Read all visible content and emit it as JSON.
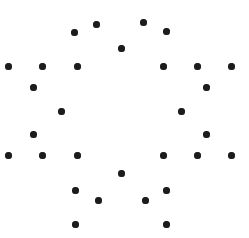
{
  "canvas": {
    "width": 249,
    "height": 238,
    "background_color": "#ffffff",
    "description": "Scattered black dot pattern forming a symmetric hexagonal/flower-like arrangement"
  },
  "marker": {
    "shape": "filled-circle",
    "color": "#1c1c1c",
    "diameter": 7,
    "count": 28
  },
  "chart_data": {
    "type": "scatter",
    "title": "",
    "subtitle": "",
    "xlabel": "",
    "ylabel": "",
    "grid": false,
    "legend": "none",
    "xlim": [
      0,
      249
    ],
    "ylim": [
      0,
      238
    ],
    "axis_visible": false,
    "tick_labels_x": [],
    "tick_labels_y": [],
    "annotations": [],
    "series": [
      {
        "name": "dots",
        "color": "#1c1c1c",
        "marker": "circle",
        "size": 7,
        "points": [
          {
            "x": 96,
            "y": 24
          },
          {
            "x": 143,
            "y": 22
          },
          {
            "x": 74,
            "y": 32
          },
          {
            "x": 166,
            "y": 31
          },
          {
            "x": 121,
            "y": 48
          },
          {
            "x": 8,
            "y": 66
          },
          {
            "x": 42,
            "y": 66
          },
          {
            "x": 77,
            "y": 66
          },
          {
            "x": 163,
            "y": 66
          },
          {
            "x": 197,
            "y": 66
          },
          {
            "x": 231,
            "y": 66
          },
          {
            "x": 33,
            "y": 87
          },
          {
            "x": 206,
            "y": 87
          },
          {
            "x": 61,
            "y": 111
          },
          {
            "x": 181,
            "y": 111
          },
          {
            "x": 33,
            "y": 134
          },
          {
            "x": 206,
            "y": 134
          },
          {
            "x": 8,
            "y": 155
          },
          {
            "x": 42,
            "y": 155
          },
          {
            "x": 77,
            "y": 155
          },
          {
            "x": 163,
            "y": 155
          },
          {
            "x": 197,
            "y": 155
          },
          {
            "x": 231,
            "y": 155
          },
          {
            "x": 121,
            "y": 173
          },
          {
            "x": 75,
            "y": 190
          },
          {
            "x": 166,
            "y": 190
          },
          {
            "x": 98,
            "y": 200
          },
          {
            "x": 145,
            "y": 200
          },
          {
            "x": 75,
            "y": 224
          },
          {
            "x": 166,
            "y": 224
          }
        ]
      }
    ]
  }
}
